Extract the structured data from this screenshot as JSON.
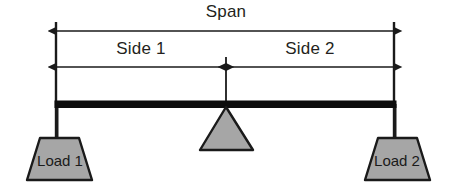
{
  "diagram": {
    "colors": {
      "fill_gray": "#a6a6a6",
      "stroke_black": "#1a1a1a",
      "beam_black": "#0d0d0d",
      "background": "#ffffff",
      "text": "#231f20"
    },
    "dimensions": {
      "span": {
        "label": "Span",
        "style": "double-headed-arrow",
        "from_x": 56,
        "to_x": 394,
        "y": 31
      },
      "side1": {
        "label": "Side 1",
        "style": "double-headed-arrow",
        "from_x": 56,
        "to_x": 226,
        "y": 67
      },
      "side2": {
        "label": "Side 2",
        "style": "double-headed-arrow",
        "from_x": 226,
        "to_x": 394,
        "y": 67
      }
    },
    "beam": {
      "name": "beam",
      "from_x": 55,
      "to_x": 396,
      "y": 101,
      "thickness": 6
    },
    "fulcrum": {
      "label": "",
      "shape": "triangle",
      "apex_x": 226,
      "apex_y": 108,
      "base_y": 150,
      "base_left_x": 200,
      "base_right_x": 253
    },
    "loads": [
      {
        "label": "Load 1",
        "shape": "trapezoid",
        "center_x": 59,
        "top_y": 138,
        "bottom_y": 180
      },
      {
        "label": "Load 2",
        "shape": "trapezoid",
        "center_x": 397,
        "top_y": 138,
        "bottom_y": 180
      }
    ],
    "extension_lines": [
      {
        "name": "left-extension-line",
        "x": 56,
        "from_y": 22,
        "to_y": 146
      },
      {
        "name": "right-extension-line",
        "x": 394,
        "from_y": 22,
        "to_y": 142
      },
      {
        "name": "center-extension-line",
        "x": 226,
        "from_y": 57,
        "to_y": 110
      }
    ]
  }
}
